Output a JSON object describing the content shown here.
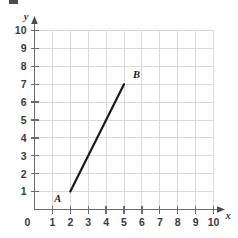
{
  "figure": {
    "name": "coordinate-plane-line-segment",
    "background_color": "#ffffff",
    "grid_color": "#d9d9d9",
    "axis_color": "#6a6b6e",
    "segment_color": "#1b1b1d",
    "label_color": "#3a3a3c"
  },
  "axes": {
    "x": {
      "label": "x",
      "min": 0,
      "max": 10,
      "ticks": [
        0,
        1,
        2,
        3,
        4,
        5,
        6,
        7,
        8,
        9,
        10
      ],
      "tick_labels": [
        "0",
        "1",
        "2",
        "3",
        "4",
        "5",
        "6",
        "7",
        "8",
        "9",
        "10"
      ],
      "has_arrow": true
    },
    "y": {
      "label": "y",
      "min": 0,
      "max": 10,
      "ticks": [
        1,
        2,
        3,
        4,
        5,
        6,
        7,
        8,
        9,
        10
      ],
      "tick_labels": [
        "1",
        "2",
        "3",
        "4",
        "5",
        "6",
        "7",
        "8",
        "9",
        "10"
      ],
      "has_arrow": true
    }
  },
  "chart_data": {
    "type": "line",
    "title": "",
    "xlabel": "x",
    "ylabel": "y",
    "xlim": [
      0,
      10
    ],
    "ylim": [
      0,
      10
    ],
    "grid": true,
    "legend": "none",
    "series": [
      {
        "name": "segment-AB",
        "x": [
          2,
          5
        ],
        "y": [
          1,
          7
        ],
        "color": "#1b1b1d"
      }
    ],
    "points": [
      {
        "label": "A",
        "x": 2,
        "y": 1,
        "label_position": "below-left"
      },
      {
        "label": "B",
        "x": 5,
        "y": 7,
        "label_position": "above-right"
      }
    ]
  }
}
